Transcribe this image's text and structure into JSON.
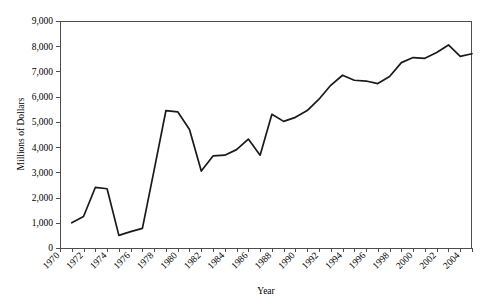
{
  "chart_data": {
    "type": "line",
    "title": "",
    "xlabel": "Year",
    "ylabel": "Millions of Dollars",
    "xlim": [
      1970,
      2005
    ],
    "ylim": [
      0,
      9000
    ],
    "grid": false,
    "legend": "none",
    "x_tick_labels": [
      "1970",
      "1972",
      "1974",
      "1976",
      "1978",
      "1980",
      "1982",
      "1984",
      "1986",
      "1988",
      "1990",
      "1992",
      "1994",
      "1996",
      "1998",
      "2000",
      "2002",
      "2004"
    ],
    "x_tick_values": [
      1970,
      1972,
      1974,
      1976,
      1978,
      1980,
      1982,
      1984,
      1986,
      1988,
      1990,
      1992,
      1994,
      1996,
      1998,
      2000,
      2002,
      2004
    ],
    "x_minor_tick_interval": 1,
    "y_tick_labels": [
      "0",
      "1,000",
      "2,000",
      "3,000",
      "4,000",
      "5,000",
      "6,000",
      "7,000",
      "8,000",
      "9,000"
    ],
    "y_tick_values": [
      0,
      1000,
      2000,
      3000,
      4000,
      5000,
      6000,
      7000,
      8000,
      9000
    ],
    "series": [
      {
        "name": "Millions of Dollars",
        "color": "#1a1a1a",
        "x": [
          1971,
          1972,
          1973,
          1974,
          1975,
          1976,
          1977,
          1978,
          1979,
          1980,
          1981,
          1982,
          1983,
          1984,
          1985,
          1986,
          1987,
          1988,
          1989,
          1990,
          1991,
          1992,
          1993,
          1994,
          1995,
          1996,
          1997,
          1998,
          1999,
          2000,
          2001,
          2002,
          2003,
          2004,
          2005
        ],
        "values": [
          1000,
          1250,
          2400,
          2350,
          500,
          650,
          780,
          3100,
          5450,
          5400,
          4700,
          3050,
          3650,
          3680,
          3900,
          4320,
          3680,
          5300,
          5020,
          5180,
          5450,
          5900,
          6450,
          6850,
          6650,
          6620,
          6520,
          6800,
          7350,
          7550,
          7520,
          7750,
          8050,
          7600,
          7700
        ]
      }
    ]
  },
  "axes": {
    "y_axis_title": "Millions of Dollars",
    "x_axis_title": "Year"
  }
}
